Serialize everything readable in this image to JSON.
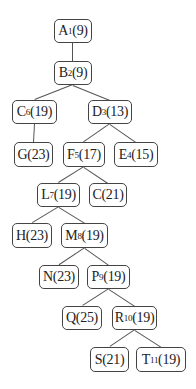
{
  "diagram": {
    "type": "tree",
    "nodes": [
      {
        "id": "A",
        "label": "A",
        "sub": "1",
        "value": "(9)",
        "box": [
          54,
          19,
          38,
          24
        ]
      },
      {
        "id": "B",
        "label": "B",
        "sub": "2",
        "value": "(9)",
        "box": [
          54,
          61,
          38,
          24
        ]
      },
      {
        "id": "C6",
        "label": "C",
        "sub": "6",
        "value": "(19)",
        "box": [
          12,
          100,
          45,
          24
        ]
      },
      {
        "id": "D",
        "label": "D",
        "sub": "3",
        "value": "(13)",
        "box": [
          88,
          100,
          44,
          24
        ]
      },
      {
        "id": "G",
        "label": "G",
        "sub": "",
        "value": "(23)",
        "box": [
          14,
          142,
          39,
          25
        ]
      },
      {
        "id": "F",
        "label": "F",
        "sub": "5",
        "value": "(17)",
        "box": [
          63,
          142,
          42,
          25
        ]
      },
      {
        "id": "E",
        "label": "E",
        "sub": "4",
        "value": "(15)",
        "box": [
          114,
          142,
          44,
          25
        ]
      },
      {
        "id": "L",
        "label": "L",
        "sub": "7",
        "value": "(19)",
        "box": [
          37,
          183,
          43,
          24
        ]
      },
      {
        "id": "C21",
        "label": "C",
        "sub": "",
        "value": "(21)",
        "box": [
          89,
          183,
          38,
          24
        ]
      },
      {
        "id": "H",
        "label": "H",
        "sub": "",
        "value": "(23)",
        "box": [
          12,
          223,
          40,
          25
        ]
      },
      {
        "id": "M",
        "label": "M",
        "sub": "8",
        "value": "(19)",
        "box": [
          61,
          223,
          47,
          25
        ]
      },
      {
        "id": "N",
        "label": "N",
        "sub": "",
        "value": "(23)",
        "box": [
          39,
          265,
          40,
          24
        ]
      },
      {
        "id": "P",
        "label": "P",
        "sub": "9",
        "value": "(19)",
        "box": [
          87,
          265,
          43,
          24
        ]
      },
      {
        "id": "Q",
        "label": "Q",
        "sub": "",
        "value": "(25)",
        "box": [
          62,
          306,
          40,
          24
        ]
      },
      {
        "id": "R",
        "label": "R",
        "sub": "10",
        "value": "(19)",
        "box": [
          112,
          306,
          45,
          24
        ]
      },
      {
        "id": "S",
        "label": "S",
        "sub": "",
        "value": "(21)",
        "box": [
          90,
          347,
          39,
          25
        ]
      },
      {
        "id": "T",
        "label": "T",
        "sub": "11",
        "value": "(19)",
        "box": [
          136,
          347,
          50,
          25
        ]
      }
    ],
    "edges": [
      [
        "A",
        "B"
      ],
      [
        "B",
        "C6"
      ],
      [
        "B",
        "D"
      ],
      [
        "C6",
        "G"
      ],
      [
        "D",
        "F"
      ],
      [
        "D",
        "E"
      ],
      [
        "F",
        "L"
      ],
      [
        "F",
        "C21"
      ],
      [
        "L",
        "H"
      ],
      [
        "L",
        "M"
      ],
      [
        "M",
        "N"
      ],
      [
        "M",
        "P"
      ],
      [
        "P",
        "Q"
      ],
      [
        "P",
        "R"
      ],
      [
        "R",
        "S"
      ],
      [
        "R",
        "T"
      ]
    ]
  }
}
